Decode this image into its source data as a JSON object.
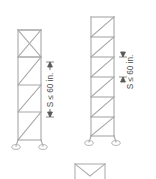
{
  "document": {
    "title": "Tower Bracing Elevations",
    "background_color": "#ffffff",
    "line_color": "#a8a8a8",
    "text_color": "#4a4a4a"
  },
  "figures": [
    {
      "id": "left-tower",
      "name": "X-braced tower elevation",
      "bracing_type": "zigzag-x",
      "panel_count": 4,
      "has_base_supports": true,
      "base_support_count": 2,
      "base_support_type": "pin"
    },
    {
      "id": "right-tower",
      "name": "Z-braced tower elevation",
      "bracing_type": "z-diagonal-with-horizontals",
      "panel_count": 6,
      "has_base_supports": true,
      "base_support_count": 2,
      "base_support_type": "pin"
    },
    {
      "id": "bottom-detail",
      "name": "Truss detail fragment",
      "bracing_type": "v-truss",
      "panel_count": 1,
      "has_base_supports": false
    }
  ],
  "annotations": [
    {
      "id": "dim-left",
      "label": "S ≤ 60 in.",
      "value": 60,
      "unit": "in.",
      "symbol": "≤",
      "variable": "S",
      "orientation": "vertical",
      "rotation_deg": -90,
      "arrow_style": "double-ended"
    },
    {
      "id": "dim-right",
      "label": "S ≤ 60 in.",
      "value": 60,
      "unit": "in.",
      "symbol": "≤",
      "variable": "S",
      "orientation": "vertical",
      "rotation_deg": -90,
      "arrow_style": "double-ended"
    }
  ],
  "legend": {
    "variable_meaning": "S",
    "max_spacing_label": "S ≤ 60 in."
  }
}
